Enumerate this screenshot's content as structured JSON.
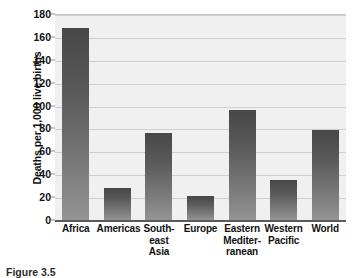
{
  "chart_data": {
    "type": "bar",
    "title": "",
    "subtitle": "",
    "xlabel": "",
    "ylabel": "Deaths per 1,000 live births",
    "ylim": [
      0,
      180
    ],
    "yticks": [
      0,
      20,
      40,
      60,
      80,
      100,
      120,
      140,
      160,
      180
    ],
    "grid": true,
    "legend": false,
    "legend_position": "none",
    "categories": [
      "Africa",
      "Americas",
      "South-east Asia",
      "Europe",
      "Eastern Mediterranean",
      "Western Pacific",
      "World"
    ],
    "category_lines": [
      [
        "Africa"
      ],
      [
        "Americas"
      ],
      [
        "South-",
        "east",
        "Asia"
      ],
      [
        "Europe"
      ],
      [
        "Eastern",
        "Mediter-",
        "ranean"
      ],
      [
        "Western",
        "Pacific"
      ],
      [
        "World"
      ]
    ],
    "values": [
      168,
      28,
      76,
      21,
      96,
      35,
      79
    ],
    "bar_color_top": "#474747",
    "bar_color_bottom": "#949494",
    "plot_background": "#f0f0f0",
    "gridline_color": "#cfcfcf"
  },
  "caption": {
    "text": "Figure 3.5"
  }
}
